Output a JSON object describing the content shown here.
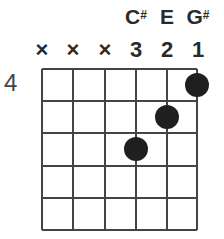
{
  "chord": {
    "start_fret": "4",
    "strings": [
      {
        "string": 6,
        "marker": "×",
        "note": "",
        "note_sharp": "",
        "muted": true
      },
      {
        "string": 5,
        "marker": "×",
        "note": "",
        "note_sharp": "",
        "muted": true
      },
      {
        "string": 4,
        "marker": "×",
        "note": "",
        "note_sharp": "",
        "muted": true
      },
      {
        "string": 3,
        "marker": "3",
        "note": "C",
        "note_sharp": "#",
        "fret_offset": 3
      },
      {
        "string": 2,
        "marker": "2",
        "note": "E",
        "note_sharp": "",
        "fret_offset": 2
      },
      {
        "string": 1,
        "marker": "1",
        "note": "G",
        "note_sharp": "#",
        "fret_offset": 1
      }
    ],
    "num_frets_shown": 5,
    "dot_color": "#1f1f1f",
    "line_color": "#444444"
  }
}
